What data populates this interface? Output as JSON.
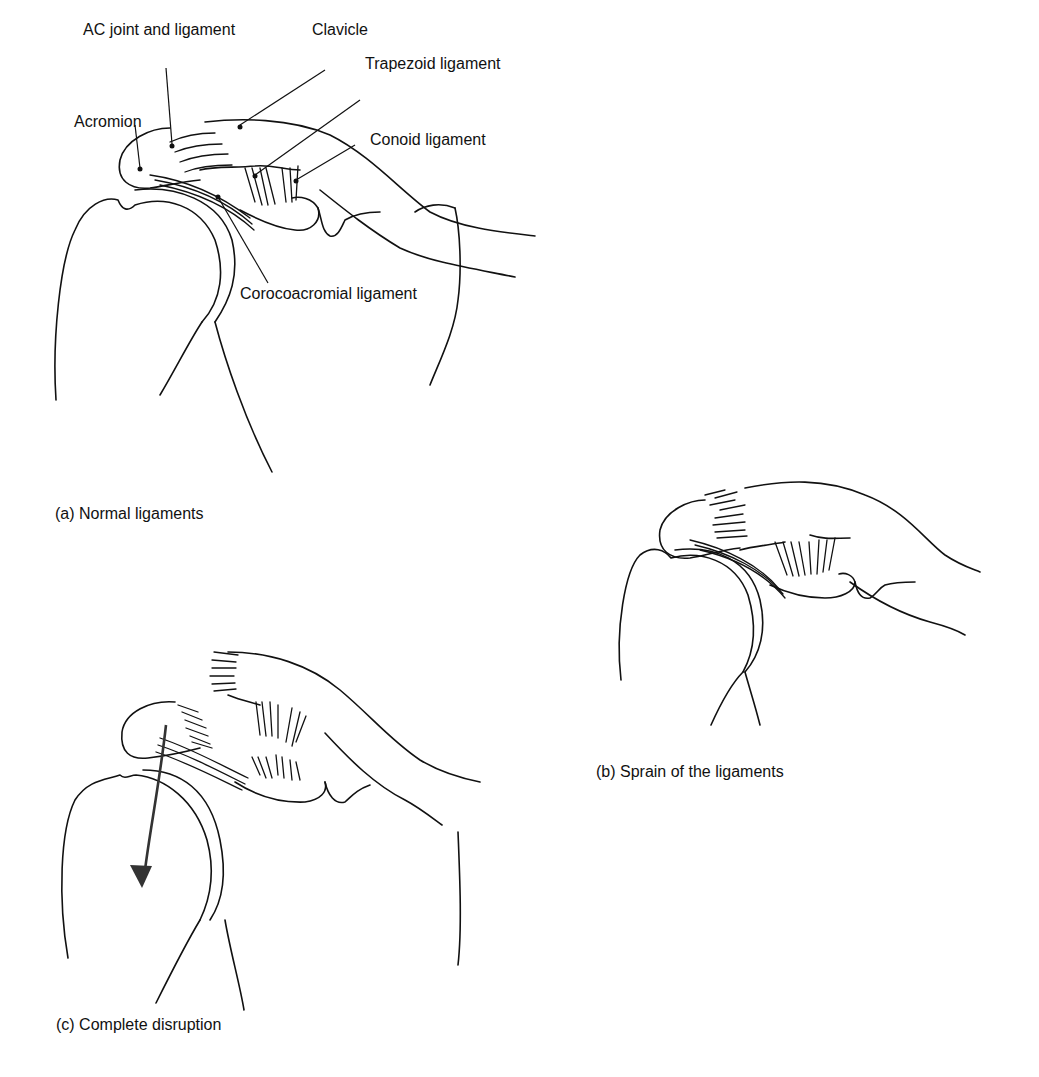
{
  "figure": {
    "panel_a": {
      "caption": "(a) Normal ligaments",
      "labels": {
        "ac_joint": "AC joint and ligament",
        "clavicle": "Clavicle",
        "trapezoid": "Trapezoid ligament",
        "acromion": "Acromion",
        "conoid": "Conoid ligament",
        "corocoacromial": "Corocoacromial ligament"
      }
    },
    "panel_b": {
      "caption": "(b) Sprain of the ligaments"
    },
    "panel_c": {
      "caption": "(c) Complete disruption",
      "arrow": "downward-arrow"
    },
    "colors": {
      "line": "#111111",
      "background": "#ffffff",
      "arrow": "#333333"
    }
  }
}
